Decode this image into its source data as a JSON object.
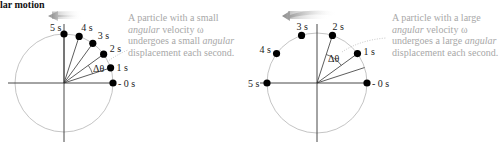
{
  "title": "lar motion",
  "colors": {
    "circle": "#b5b5b5",
    "axis": "#333333",
    "dot": "#000000",
    "caption": "#a8a8a8",
    "arrow": "#9a9a9a"
  },
  "left_panel": {
    "caption": {
      "line1": "A particle with a small",
      "line2_italic": "angular",
      "line2_rest": " velocity ω",
      "line3_pre": "undergoes a small ",
      "line3_italic": "angular",
      "line4": "displacement each second."
    },
    "delta_label": "Δθ",
    "points": [
      {
        "label": "0 s",
        "angle_deg": 0
      },
      {
        "label": "1 s",
        "angle_deg": 18
      },
      {
        "label": "2 s",
        "angle_deg": 36
      },
      {
        "label": "3 s",
        "angle_deg": 54
      },
      {
        "label": "4 s",
        "angle_deg": 72
      },
      {
        "label": "5 s",
        "angle_deg": 90
      }
    ]
  },
  "right_panel": {
    "caption": {
      "line1": "A particle with a large",
      "line2_italic": "angular",
      "line2_rest": " velocity ω",
      "line3_pre": "undergoes a large ",
      "line3_italic": "angular",
      "line4": "displacement each second."
    },
    "delta_label": "Δθ",
    "points": [
      {
        "label": "0 s",
        "angle_deg": 0
      },
      {
        "label": "1 s",
        "angle_deg": 36
      },
      {
        "label": "2 s",
        "angle_deg": 72
      },
      {
        "label": "3 s",
        "angle_deg": 108
      },
      {
        "label": "4 s",
        "angle_deg": 144
      },
      {
        "label": "5 s",
        "angle_deg": 180
      }
    ]
  }
}
